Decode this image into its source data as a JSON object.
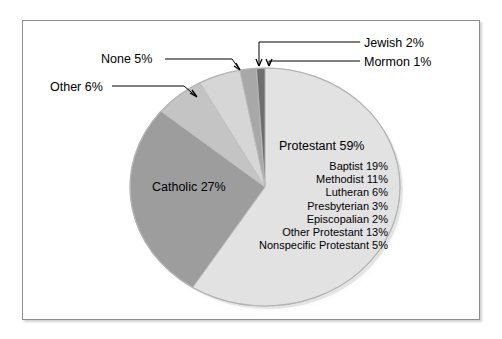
{
  "chart_data": {
    "type": "pie",
    "title": "",
    "categories": [
      "Protestant",
      "Catholic",
      "Other",
      "None",
      "Jewish",
      "Mormon"
    ],
    "values": [
      59,
      27,
      6,
      5,
      2,
      1
    ],
    "unit": "percent",
    "legend_position": "none",
    "grid": false,
    "labels": [
      {
        "name": "Protestant",
        "value": 59,
        "text": "Protestant  59%",
        "placement": "inside"
      },
      {
        "name": "Catholic",
        "value": 27,
        "text": "Catholic  27%",
        "placement": "inside"
      },
      {
        "name": "Other",
        "value": 6,
        "text": "Other 6%",
        "placement": "leader-line"
      },
      {
        "name": "None",
        "value": 5,
        "text": "None 5%",
        "placement": "leader-line"
      },
      {
        "name": "Jewish",
        "value": 2,
        "text": "Jewish 2%",
        "placement": "leader-line"
      },
      {
        "name": "Mormon",
        "value": 1,
        "text": "Mormon 1%",
        "placement": "leader-line"
      }
    ],
    "breakdown": {
      "parent": "Protestant",
      "items": [
        {
          "name": "Baptist",
          "value": 19,
          "text": "Baptist 19%"
        },
        {
          "name": "Methodist",
          "value": 11,
          "text": "Methodist 11%"
        },
        {
          "name": "Lutheran",
          "value": 6,
          "text": "Lutheran 6%"
        },
        {
          "name": "Presbyterian",
          "value": 3,
          "text": "Presbyterian 3%"
        },
        {
          "name": "Episcopalian",
          "value": 2,
          "text": "Episcopalian 2%"
        },
        {
          "name": "Other Protestant",
          "value": 13,
          "text": "Other Protestant 13%"
        },
        {
          "name": "Nonspecific Protestant",
          "value": 5,
          "text": "Nonspecific Protestant 5%"
        }
      ]
    },
    "colors": {
      "protestant": "#e2e2e2",
      "catholic": "#9d9d9d",
      "other": "#c4c4c4",
      "none": "#d6d6d6",
      "jewish": "#a8a8a8",
      "mormon": "#6e6e6e",
      "slice_edge": "#bdbdbd",
      "frame_border": "#8c8c8c",
      "leader_line": "#000000",
      "background": "#ffffff",
      "text": "#000000"
    }
  },
  "chart": {
    "protestant_label": "Protestant  59%",
    "catholic_label": "Catholic  27%",
    "none_label": "None 5%",
    "other_label": "Other 6%",
    "jewish_label": "Jewish 2%",
    "mormon_label": "Mormon 1%",
    "sub": {
      "baptist": "Baptist 19%",
      "methodist": "Methodist 11%",
      "lutheran": "Lutheran 6%",
      "presbyterian": "Presbyterian 3%",
      "episcopalian": "Episcopalian 2%",
      "other_protestant": "Other Protestant 13%",
      "nonspecific_protestant": "Nonspecific Protestant 5%"
    }
  }
}
